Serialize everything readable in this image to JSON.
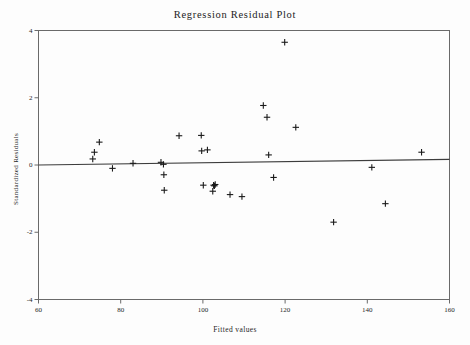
{
  "chart_data": {
    "type": "scatter",
    "title": "Regression Residual Plot",
    "xlabel": "Fitted values",
    "ylabel": "Standardized Residuals",
    "xlim": [
      60,
      160
    ],
    "ylim": [
      -4,
      4
    ],
    "xticks": [
      60,
      80,
      100,
      120,
      140,
      160
    ],
    "yticks": [
      4,
      2,
      0,
      -2,
      -4
    ],
    "xtick_labels": [
      "60",
      "80",
      "100",
      "120",
      "140",
      "160"
    ],
    "ytick_labels": [
      "4",
      "2",
      "0",
      "-2",
      "-4"
    ],
    "grid": false,
    "legend": "none",
    "marker": "plus",
    "marker_color": "#1a1a1a",
    "reference_line": {
      "name": "zero-residual-line",
      "x": [
        60,
        160
      ],
      "y": [
        0.0,
        0.17
      ],
      "color": "#3d3d3d"
    },
    "x": [
      73.2,
      73.6,
      74.8,
      78.0,
      83.0,
      89.8,
      90.4,
      90.5,
      90.6,
      94.2,
      99.6,
      99.7,
      100.1,
      101.1,
      102.4,
      102.6,
      102.8,
      103.0,
      106.6,
      109.5,
      114.7,
      115.6,
      116.0,
      117.2,
      119.9,
      122.6,
      131.8,
      141.1,
      144.4,
      153.2
    ],
    "y": [
      0.18,
      0.38,
      0.68,
      -0.1,
      0.05,
      0.08,
      0.02,
      -0.29,
      -0.75,
      0.87,
      0.88,
      0.42,
      -0.6,
      0.45,
      -0.78,
      -0.6,
      -0.62,
      -0.58,
      -0.88,
      -0.94,
      1.77,
      1.42,
      0.3,
      -0.37,
      3.65,
      1.12,
      -1.7,
      -0.07,
      -1.15,
      0.38
    ],
    "n_points": 30
  },
  "axes": {
    "frame_color": "#6a6a6a",
    "background": "#fdfdfd"
  }
}
